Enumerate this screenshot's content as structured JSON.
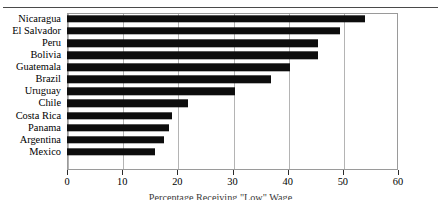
{
  "chart_data": {
    "type": "bar",
    "orientation": "horizontal",
    "title": "",
    "xlabel": "Percentage Receiving \"Low\" Wage",
    "ylabel": "",
    "xlim": [
      0,
      60
    ],
    "xticks": [
      0,
      10,
      20,
      30,
      40,
      50,
      60
    ],
    "xticklabels": [
      "0",
      "10",
      "20",
      "30",
      "40",
      "50",
      "60"
    ],
    "grid": "vertical",
    "legend": "none",
    "bar_color": "#0d0d0d",
    "categories": [
      "Nicaragua",
      "El Salvador",
      "Peru",
      "Bolivia",
      "Guatemala",
      "Brazil",
      "Uruguay",
      "Chile",
      "Costa Rica",
      "Panama",
      "Argentina",
      "Mexico"
    ],
    "values": [
      54,
      49.5,
      45.5,
      45.5,
      40.5,
      37,
      30.5,
      22,
      19,
      18.5,
      17.5,
      16
    ]
  }
}
